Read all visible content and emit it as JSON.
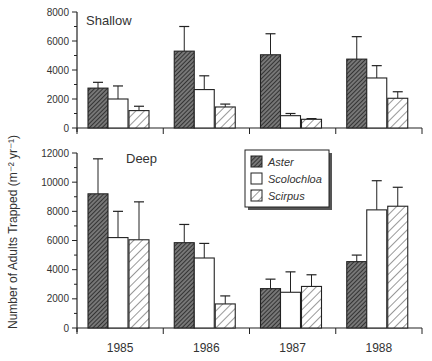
{
  "chart_data": [
    {
      "type": "bar",
      "panel": "Shallow",
      "title": "Shallow",
      "categories": [
        "1985",
        "1986",
        "1987",
        "1988"
      ],
      "series": [
        {
          "name": "Aster",
          "values": [
            2750,
            5300,
            5050,
            4750
          ],
          "error_upper": [
            3150,
            7000,
            6500,
            6300
          ]
        },
        {
          "name": "Scolochloa",
          "values": [
            2000,
            2650,
            850,
            3450
          ],
          "error_upper": [
            2900,
            3600,
            1000,
            4300
          ]
        },
        {
          "name": "Scirpus",
          "values": [
            1200,
            1450,
            600,
            2050
          ],
          "error_upper": [
            1500,
            1650,
            650,
            2500
          ]
        }
      ],
      "ylim": [
        0,
        8000
      ],
      "yticks": [
        0,
        2000,
        4000,
        6000,
        8000
      ],
      "grid": false
    },
    {
      "type": "bar",
      "panel": "Deep",
      "title": "Deep",
      "categories": [
        "1985",
        "1986",
        "1987",
        "1988"
      ],
      "series": [
        {
          "name": "Aster",
          "values": [
            9200,
            5850,
            2700,
            4550
          ],
          "error_upper": [
            11600,
            7100,
            3350,
            5000
          ]
        },
        {
          "name": "Scolochloa",
          "values": [
            6200,
            4800,
            2450,
            8100
          ],
          "error_upper": [
            8000,
            5800,
            3850,
            10100
          ]
        },
        {
          "name": "Scirpus",
          "values": [
            6050,
            1650,
            2850,
            8350
          ],
          "error_upper": [
            8650,
            2200,
            3650,
            9650
          ]
        }
      ],
      "ylim": [
        0,
        12000
      ],
      "yticks": [
        0,
        2000,
        4000,
        6000,
        8000,
        10000,
        12000
      ],
      "grid": false,
      "legend_position": "top-center"
    }
  ],
  "labels": {
    "ylabel": "Number of Adults Trapped (m⁻² yr⁻¹)",
    "shallow": "Shallow",
    "deep": "Deep",
    "years": [
      "1985",
      "1986",
      "1987",
      "1988"
    ],
    "legend": [
      "Aster",
      "Scolochloa",
      "Scirpus"
    ],
    "top_ticks": [
      "0",
      "2000",
      "4000",
      "6000",
      "8000"
    ],
    "bottom_ticks": [
      "0",
      "2000",
      "4000",
      "6000",
      "8000",
      "10000",
      "12000"
    ]
  }
}
